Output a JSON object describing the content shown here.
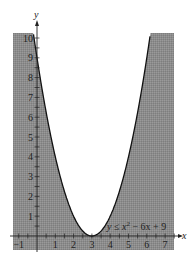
{
  "chart_data": {
    "type": "area",
    "title": "",
    "xlabel": "x",
    "ylabel": "y",
    "xlim": [
      -1.3,
      7.5
    ],
    "ylim": [
      -0.6,
      10.2
    ],
    "x_ticks": [
      "-1",
      "1",
      "2",
      "3",
      "4",
      "5",
      "6",
      "7"
    ],
    "y_ticks": [
      "1",
      "2",
      "3",
      "4",
      "5",
      "6",
      "7",
      "8",
      "9",
      "10"
    ],
    "grid": false,
    "curve": {
      "expression": "y = x^2 - 6x + 9",
      "vertex": [
        3,
        0
      ]
    },
    "shaded_region": "y <= x^2 - 6x + 9",
    "annotation": {
      "text_main": "y ≤ x",
      "superscript": "2",
      "text_tail": " − 6x + 9",
      "position": [
        4.5,
        0.5
      ]
    },
    "colors": {
      "shade": "#8c8c8c",
      "curve": "#111111",
      "axis": "#222222"
    }
  }
}
